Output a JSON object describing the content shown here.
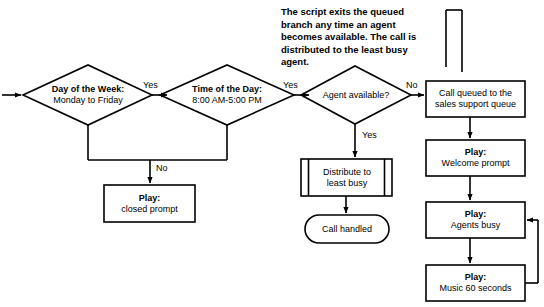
{
  "diagram": {
    "background_color": "#ffffff",
    "stroke_color": "#000000",
    "annotation": "The script exits the queued branch any time an agent becomes available. The call is distributed to the least busy agent.",
    "nodes": {
      "day_of_week": {
        "shape": "decision",
        "line1": "Day of the Week:",
        "line2": "Monday to Friday"
      },
      "time_of_day": {
        "shape": "decision",
        "line1": "Time of the Day:",
        "line2": "8:00 AM-5:00 PM"
      },
      "agent_available": {
        "shape": "decision",
        "line1": "Agent available?"
      },
      "closed_prompt": {
        "shape": "process",
        "line1": "Play:",
        "line2": "closed prompt"
      },
      "distribute_least_busy": {
        "shape": "predefined-process",
        "line1": "Distribute to",
        "line2": "least busy"
      },
      "call_handled": {
        "shape": "terminator",
        "line1": "Call handled"
      },
      "call_queued": {
        "shape": "process",
        "line1": "Call queued to the",
        "line2": "sales support queue"
      },
      "welcome_prompt": {
        "shape": "process",
        "line1": "Play:",
        "line2": "Welcome prompt"
      },
      "agents_busy": {
        "shape": "process",
        "line1": "Play:",
        "line2": "Agents busy"
      },
      "music_60_seconds": {
        "shape": "process",
        "line1": "Play:",
        "line2": "Music 60 seconds"
      }
    },
    "edge_labels": {
      "day_yes": "Yes",
      "time_yes": "Yes",
      "closed_no": "No",
      "agent_yes": "Yes",
      "agent_no": "No"
    }
  }
}
